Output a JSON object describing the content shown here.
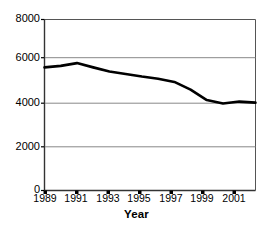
{
  "chart_data": {
    "type": "line",
    "title": "",
    "xlabel": "Year",
    "ylabel": "",
    "x": [
      1989,
      1990,
      1991,
      1992,
      1993,
      1994,
      1995,
      1996,
      1997,
      1998,
      1999,
      2000,
      2001,
      2002
    ],
    "series": [
      {
        "name": "value",
        "values": [
          5760,
          5830,
          5960,
          5760,
          5570,
          5450,
          5330,
          5230,
          5080,
          4720,
          4230,
          4070,
          4160,
          4110
        ]
      }
    ],
    "xlim": [
      1989,
      2002
    ],
    "ylim": [
      0,
      8000
    ],
    "ytick_labels": [
      "8000",
      "6000",
      "4000",
      "2000",
      "0"
    ],
    "ytick_values": [
      8000,
      6000,
      4000,
      2000,
      0
    ],
    "xtick_labels": [
      "1989",
      "1991",
      "1993",
      "1995",
      "1997",
      "1999",
      "2001"
    ],
    "xtick_values": [
      1989,
      1991,
      1993,
      1995,
      1997,
      1999,
      2001
    ],
    "grid": "horizontal",
    "legend": "none",
    "line_color": "#000000",
    "grid_color": "#808080",
    "axis_color": "#000000",
    "background_color": "#ffffff"
  },
  "axes": {
    "x_title": "Year"
  }
}
